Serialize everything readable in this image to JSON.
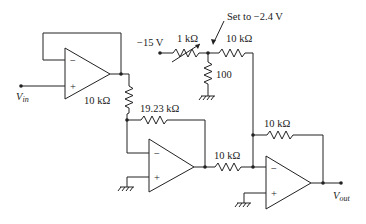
{
  "diagram": {
    "type": "op-amp circuit schematic",
    "labels": {
      "vin": "V",
      "vin_sub": "in",
      "vout": "V",
      "vout_sub": "out",
      "r_buffer_out": "10 kΩ",
      "r_feedback_2": "19.23 kΩ",
      "r_series_3": "10 kΩ",
      "r_feedback_3": "10 kΩ",
      "supply": "−15 V",
      "pot": "1 kΩ",
      "r_offset": "10 kΩ",
      "r_shunt": "100",
      "annotation": "Set to −2.4 V",
      "minus": "−",
      "plus": "+"
    },
    "components": [
      {
        "id": "opamp1",
        "role": "voltage follower buffer"
      },
      {
        "id": "opamp2",
        "role": "inverting amplifier",
        "rin": "10 kΩ",
        "rf": "19.23 kΩ"
      },
      {
        "id": "opamp3",
        "role": "inverting summer",
        "inputs": [
          "10 kΩ from opamp2",
          "10 kΩ from offset divider"
        ],
        "rf": "10 kΩ"
      },
      {
        "id": "offset-divider",
        "parts": [
          "−15 V",
          "1 kΩ potentiometer",
          "100 Ω to ground"
        ],
        "note": "Set to −2.4 V"
      }
    ]
  }
}
